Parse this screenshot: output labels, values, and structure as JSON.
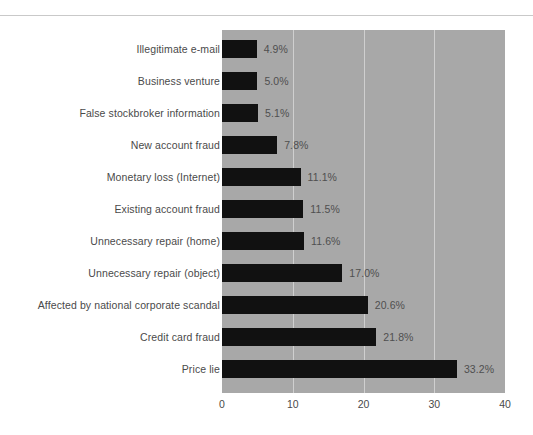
{
  "chart_data": {
    "type": "bar",
    "orientation": "horizontal",
    "title": "",
    "subtitle": "",
    "xlabel": "",
    "ylabel": "",
    "xlim": [
      0,
      40
    ],
    "xticks": [
      "0",
      "10",
      "20",
      "30",
      "40"
    ],
    "xtick_values": [
      0,
      10,
      20,
      30,
      40
    ],
    "grid": "vertical-white-gridlines",
    "legend": "none",
    "value_suffix": "%",
    "categories": [
      "Illegitimate e-mail",
      "Business venture",
      "False stockbroker information",
      "New account fraud",
      "Monetary loss (Internet)",
      "Existing account fraud",
      "Unnecessary repair (home)",
      "Unnecessary repair (object)",
      "Affected by national corporate scandal",
      "Credit card fraud",
      "Price lie"
    ],
    "values": [
      4.9,
      5.0,
      5.1,
      7.8,
      11.1,
      11.5,
      11.6,
      17.0,
      20.6,
      21.8,
      33.2
    ],
    "value_labels": [
      "4.9%",
      "5.0%",
      "5.1%",
      "7.8%",
      "11.1%",
      "11.5%",
      "11.6%",
      "17.0%",
      "20.6%",
      "21.8%",
      "33.2%"
    ],
    "colors": {
      "bar": "#111111",
      "panel_background": "#a8a8a8",
      "gridline": "#cfcfcf",
      "text": "#4a4a4a",
      "page_background": "#ffffff",
      "top_rule": "#c9c9c9"
    }
  }
}
